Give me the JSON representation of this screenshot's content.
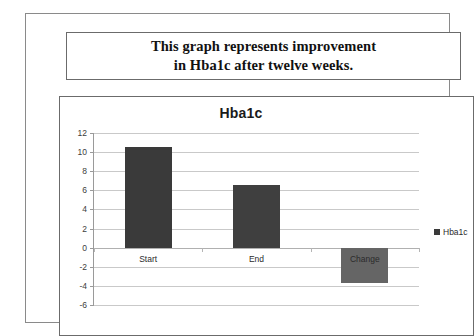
{
  "caption": {
    "line1": "This graph represents improvement",
    "line2": "in Hba1c after twelve weeks."
  },
  "chart_data": {
    "type": "bar",
    "title": "Hba1c",
    "xlabel": "",
    "ylabel": "",
    "categories": [
      "Start",
      "End",
      "Change"
    ],
    "values": [
      10.5,
      6.6,
      -3.7
    ],
    "series": [
      {
        "name": "Hba1c",
        "values": [
          10.5,
          6.6,
          -3.7
        ]
      }
    ],
    "ylim": [
      -6,
      12
    ],
    "ytick_labels": [
      "12",
      "10",
      "8",
      "6",
      "4",
      "2",
      "0",
      "-2",
      "-4",
      "-6"
    ],
    "yticks": [
      12,
      10,
      8,
      6,
      4,
      2,
      0,
      -2,
      -4,
      -6
    ],
    "grid": true,
    "legend_position": "right",
    "legend": [
      "Hba1c"
    ],
    "bar_colors": [
      "#3a3a3a",
      "#3f3f3f",
      "#656565"
    ]
  }
}
